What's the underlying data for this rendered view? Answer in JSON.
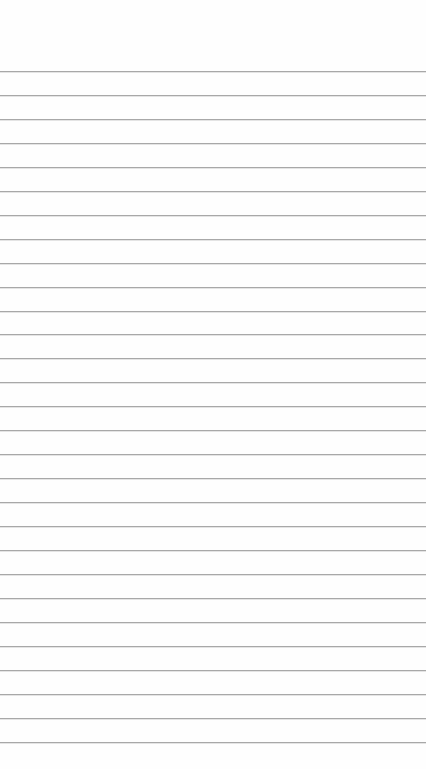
{
  "page": {
    "type": "lined-paper",
    "background_color": "#fefefe",
    "rule_color": "#a8a8a8",
    "first_rule_y": 71,
    "rule_spacing": 23.95,
    "rule_count": 29,
    "text_lines": []
  }
}
